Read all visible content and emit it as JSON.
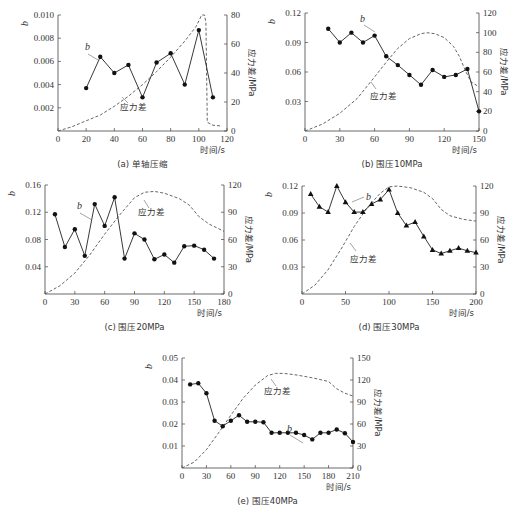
{
  "chart_data": [
    {
      "id": "a",
      "type": "line",
      "caption": "(a) 单轴压缩",
      "xlabel": "时间/s",
      "ylabel": "b",
      "y2label": "应力差/MPa",
      "xlim": [
        0,
        120
      ],
      "ylim": [
        0,
        0.01
      ],
      "y2lim": [
        0,
        80
      ],
      "xticks": [
        0,
        20,
        40,
        60,
        80,
        100,
        120
      ],
      "yticks": [
        0.002,
        0.004,
        0.006,
        0.008,
        0.01
      ],
      "ytick_labels": [
        "0.002",
        "0.004",
        "0.006",
        "0.008",
        "0.010"
      ],
      "y2ticks": [
        0,
        20,
        40,
        60,
        80
      ],
      "marker": "circle",
      "b_series": {
        "name": "b",
        "x": [
          20,
          30,
          40,
          50,
          60,
          70,
          80,
          90,
          100,
          110
        ],
        "y": [
          0.0037,
          0.0064,
          0.005,
          0.0057,
          0.0029,
          0.0059,
          0.0067,
          0.004,
          0.0087,
          0.0029
        ]
      },
      "stress_series": {
        "name": "应力差",
        "x": [
          0,
          10,
          20,
          30,
          40,
          50,
          60,
          70,
          80,
          90,
          98,
          102,
          104,
          105,
          106,
          110,
          115
        ],
        "y": [
          0,
          3,
          7,
          11,
          17,
          24,
          32,
          41,
          51,
          62,
          72,
          80,
          80,
          75,
          6,
          4,
          3.5
        ]
      },
      "box": {
        "x0": 58,
        "x1": 227,
        "y0": 15,
        "y1": 131
      },
      "b_label_pos": [
        85,
        50
      ],
      "b_leader": [
        [
          88,
          54
        ],
        [
          98,
          60
        ]
      ],
      "stress_label_pos": [
        120,
        110
      ],
      "stress_leader": [
        [
          128,
          103
        ],
        [
          122,
          97
        ]
      ]
    },
    {
      "id": "b",
      "type": "line",
      "caption": "(b) 围压10MPa",
      "xlabel": "时间/s",
      "ylabel": "b",
      "y2label": "应力差/MPa",
      "xlim": [
        0,
        150
      ],
      "ylim": [
        0,
        0.12
      ],
      "y2lim": [
        0,
        120
      ],
      "xticks": [
        0,
        30,
        60,
        90,
        120,
        150
      ],
      "yticks": [
        0.03,
        0.06,
        0.09,
        0.12
      ],
      "ytick_labels": [
        "0.03",
        "0.06",
        "0.09",
        "0.12"
      ],
      "y2ticks": [
        0,
        20,
        40,
        60,
        80,
        100,
        120
      ],
      "marker": "circle",
      "b_series": {
        "name": "b",
        "x": [
          20,
          30,
          40,
          50,
          60,
          70,
          80,
          90,
          100,
          110,
          120,
          130,
          140,
          150
        ],
        "y": [
          0.104,
          0.09,
          0.1,
          0.09,
          0.097,
          0.076,
          0.067,
          0.057,
          0.047,
          0.062,
          0.055,
          0.057,
          0.063,
          0.02
        ]
      },
      "stress_series": {
        "name": "应力差",
        "x": [
          0,
          15,
          30,
          45,
          60,
          70,
          80,
          90,
          100,
          105,
          112,
          120,
          128,
          133,
          138,
          143,
          150
        ],
        "y": [
          0,
          7,
          18,
          33,
          55,
          70,
          84,
          94,
          99,
          100,
          99,
          95,
          86,
          76,
          62,
          50,
          45
        ]
      },
      "box": {
        "x0": 305,
        "x1": 479,
        "y0": 13,
        "y1": 131
      },
      "b_label_pos": [
        360,
        22
      ],
      "b_leader": [
        [
          364,
          25
        ],
        [
          375,
          32
        ]
      ],
      "stress_label_pos": [
        370,
        99
      ],
      "stress_leader": [
        [
          376,
          89
        ],
        [
          371,
          82
        ]
      ]
    },
    {
      "id": "c",
      "type": "line",
      "caption": "(c) 围压20MPa",
      "xlabel": "时间/s",
      "ylabel": "b",
      "y2label": "应力差/MPa",
      "xlim": [
        0,
        180
      ],
      "ylim": [
        0,
        0.16
      ],
      "y2lim": [
        0,
        120
      ],
      "xticks": [
        0,
        30,
        60,
        90,
        120,
        150,
        180
      ],
      "yticks": [
        0.04,
        0.08,
        0.12,
        0.16
      ],
      "ytick_labels": [
        "0.04",
        "0.08",
        "0.12",
        "0.16"
      ],
      "y2ticks": [
        0,
        30,
        60,
        90,
        120
      ],
      "marker": "circle",
      "b_series": {
        "name": "b",
        "x": [
          10,
          20,
          30,
          40,
          50,
          60,
          70,
          80,
          90,
          100,
          110,
          120,
          130,
          140,
          150,
          160,
          170
        ],
        "y": [
          0.117,
          0.069,
          0.095,
          0.056,
          0.132,
          0.1,
          0.142,
          0.052,
          0.089,
          0.08,
          0.051,
          0.058,
          0.046,
          0.07,
          0.071,
          0.065,
          0.052
        ]
      },
      "stress_series": {
        "name": "应力差",
        "x": [
          0,
          15,
          30,
          45,
          60,
          75,
          90,
          100,
          110,
          120,
          135,
          145,
          155,
          165,
          180
        ],
        "y": [
          0,
          9,
          23,
          43,
          66,
          87,
          106,
          112,
          113,
          111,
          105,
          98,
          85,
          77,
          69
        ]
      },
      "box": {
        "x0": 45,
        "x1": 224,
        "y0": 185,
        "y1": 294
      },
      "b_label_pos": [
        77,
        209
      ],
      "b_leader": [
        [
          80,
          213
        ],
        [
          92,
          220
        ]
      ],
      "stress_label_pos": [
        138,
        215
      ],
      "stress_leader": [
        [
          149,
          208
        ],
        [
          144,
          200
        ]
      ]
    },
    {
      "id": "d",
      "type": "line",
      "caption": "(d) 围压30MPa",
      "xlabel": "时间/s",
      "ylabel": "b",
      "y2label": "应力差/MPa",
      "xlim": [
        0,
        200
      ],
      "ylim": [
        0,
        0.12
      ],
      "y2lim": [
        0,
        120
      ],
      "xticks": [
        0,
        50,
        100,
        150,
        200
      ],
      "yticks": [
        0.03,
        0.06,
        0.09,
        0.12
      ],
      "ytick_labels": [
        "0.03",
        "0.06",
        "0.09",
        "0.12"
      ],
      "y2ticks": [
        0,
        30,
        60,
        90,
        120
      ],
      "marker": "triangle",
      "b_series": {
        "name": "b",
        "x": [
          10,
          20,
          30,
          40,
          50,
          60,
          70,
          80,
          90,
          100,
          110,
          120,
          130,
          140,
          150,
          160,
          170,
          180,
          190,
          200
        ],
        "y": [
          0.111,
          0.097,
          0.091,
          0.12,
          0.102,
          0.091,
          0.091,
          0.1,
          0.105,
          0.116,
          0.09,
          0.076,
          0.08,
          0.064,
          0.049,
          0.045,
          0.048,
          0.051,
          0.048,
          0.046
        ]
      },
      "stress_series": {
        "name": "应力差",
        "x": [
          0,
          15,
          30,
          45,
          60,
          75,
          90,
          100,
          110,
          125,
          140,
          150,
          160,
          170,
          185,
          200
        ],
        "y": [
          0,
          10,
          27,
          50,
          75,
          96,
          112,
          119,
          120,
          118,
          113,
          106,
          94,
          87,
          83,
          81
        ]
      },
      "box": {
        "x0": 302,
        "x1": 476,
        "y0": 186,
        "y1": 294
      },
      "b_label_pos": [
        366,
        200
      ],
      "b_leader": [
        [
          364,
          197
        ],
        [
          352,
          202
        ]
      ],
      "stress_label_pos": [
        350,
        262
      ],
      "stress_leader": [
        [
          356,
          251
        ],
        [
          350,
          243
        ]
      ]
    },
    {
      "id": "e",
      "type": "line",
      "caption": "(e) 围压40MPa",
      "xlabel": "时间/s",
      "ylabel": "b",
      "y2label": "应力差/MPa",
      "xlim": [
        0,
        210
      ],
      "ylim": [
        0,
        0.05
      ],
      "y2lim": [
        0,
        150
      ],
      "xticks": [
        0,
        30,
        60,
        90,
        120,
        150,
        180,
        210
      ],
      "yticks": [
        0.01,
        0.02,
        0.03,
        0.04,
        0.05
      ],
      "ytick_labels": [
        "0.01",
        "0.02",
        "0.03",
        "0.04",
        "0.05"
      ],
      "y2ticks": [
        0,
        30,
        60,
        90,
        120,
        150
      ],
      "marker": "circle",
      "b_series": {
        "name": "b",
        "x": [
          10,
          20,
          30,
          40,
          50,
          60,
          70,
          80,
          90,
          100,
          110,
          120,
          130,
          140,
          150,
          160,
          170,
          180,
          190,
          200,
          210
        ],
        "y": [
          0.038,
          0.0385,
          0.034,
          0.0215,
          0.019,
          0.0215,
          0.024,
          0.021,
          0.021,
          0.0208,
          0.016,
          0.016,
          0.016,
          0.016,
          0.015,
          0.013,
          0.016,
          0.016,
          0.0175,
          0.0158,
          0.0118
        ]
      },
      "stress_series": {
        "name": "应力差",
        "x": [
          0,
          15,
          30,
          45,
          60,
          75,
          90,
          105,
          115,
          125,
          140,
          160,
          180,
          190,
          200,
          210
        ],
        "y": [
          0,
          8,
          25,
          48,
          72,
          95,
          113,
          126,
          129,
          129,
          127,
          123,
          118,
          108,
          102,
          98
        ]
      },
      "box": {
        "x0": 182,
        "x1": 353,
        "y0": 358,
        "y1": 468
      },
      "b_label_pos": [
        287,
        432
      ],
      "b_leader": [
        [
          290,
          435
        ],
        [
          303,
          443
        ]
      ],
      "stress_label_pos": [
        264,
        394
      ],
      "stress_leader": [
        [
          276,
          386
        ],
        [
          271,
          379
        ]
      ]
    }
  ],
  "labels": {
    "b": "b",
    "stress": "应力差"
  }
}
